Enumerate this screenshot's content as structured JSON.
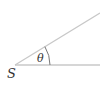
{
  "diagram": {
    "vertex_label": "S",
    "angle_label": "θ",
    "line_color": "#c8c8c8",
    "text_color": "#333333",
    "vertex": {
      "x": 15,
      "y": 65
    },
    "horizontal_ray_end": {
      "x": 100,
      "y": 65
    },
    "angled_ray_end": {
      "x": 100,
      "y": 13
    }
  }
}
